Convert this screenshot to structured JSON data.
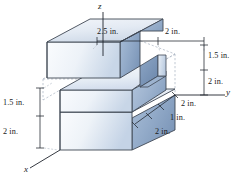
{
  "figure": {
    "kind": "isometric-engineering-drawing",
    "units": "in.",
    "background_color": "#ffffff",
    "line_color": "#3a3f4a",
    "dashed_color": "#9aa3b0",
    "face_colors": {
      "top_light": "#eef2f7",
      "top_mid": "#dce4ee",
      "front_light": "#f4f7fa",
      "front_mid": "#c9d6e5",
      "side_dark": "#8fa6c4",
      "side_mid": "#aec0d8",
      "notch_shadow": "#7e96b8"
    }
  },
  "axes": [
    {
      "name": "z",
      "label": "z"
    },
    {
      "name": "y",
      "label": "y"
    },
    {
      "name": "x",
      "label": "x"
    }
  ],
  "dimensions": [
    {
      "id": "top-left-span",
      "value": "2.5 in.",
      "orientation": "horizontal"
    },
    {
      "id": "top-right-span",
      "value": "2 in.",
      "orientation": "horizontal"
    },
    {
      "id": "right-upper",
      "value": "1.5 in.",
      "orientation": "vertical"
    },
    {
      "id": "right-lower",
      "value": "2 in.",
      "orientation": "vertical"
    },
    {
      "id": "left-upper",
      "value": "1.5 in.",
      "orientation": "vertical"
    },
    {
      "id": "left-lower",
      "value": "2 in.",
      "orientation": "vertical"
    },
    {
      "id": "depth-first",
      "value": "2 in.",
      "orientation": "oblique"
    },
    {
      "id": "depth-second",
      "value": "1 in.",
      "orientation": "oblique"
    },
    {
      "id": "depth-third",
      "value": "2 in.",
      "orientation": "oblique"
    }
  ]
}
